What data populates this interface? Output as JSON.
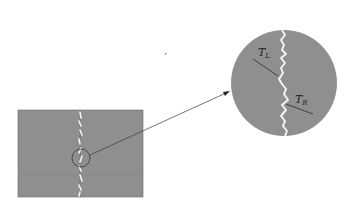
{
  "diagram": {
    "type": "magnified-crack-detail",
    "colors": {
      "background": "#ffffff",
      "specimen_fill": "#8f8f8f",
      "crack": "#f4f4f4",
      "outline": "#2a2a2a",
      "arrow": "#3a3a3a"
    },
    "specimen": {
      "label": "specimen with vertical crack"
    },
    "magnifier": {
      "label": "magnified crack region"
    },
    "labels": {
      "left_tangent": {
        "main": "T",
        "sub": "L"
      },
      "right_tangent": {
        "main": "T",
        "sub": "R"
      }
    }
  }
}
